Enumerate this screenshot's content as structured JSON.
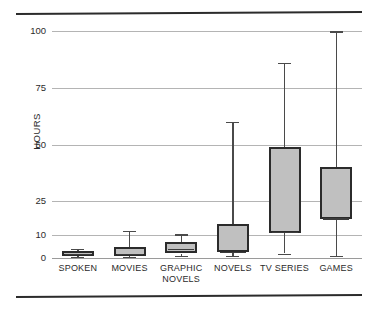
{
  "chart_data": {
    "type": "box",
    "title": "",
    "xlabel": "",
    "ylabel": "HOURS",
    "ylim": [
      0,
      100
    ],
    "yticks": [
      0,
      10,
      25,
      50,
      75,
      100
    ],
    "ytick_labels": [
      "0",
      "10",
      "25",
      "50",
      "75",
      "100"
    ],
    "grid": true,
    "legend": "none",
    "categories": [
      "SPOKEN",
      "MOVIES",
      "GRAPHIC\nNOVELS",
      "NOVELS",
      "TV SERIES",
      "GAMES"
    ],
    "boxes": [
      {
        "label": "SPOKEN",
        "whisker_low": 0.5,
        "q1": 1.0,
        "median": 2.0,
        "q3": 3.0,
        "whisker_high": 4.0
      },
      {
        "label": "MOVIES",
        "whisker_low": 0.5,
        "q1": 0.8,
        "median": 2.0,
        "q3": 5.0,
        "whisker_high": 12.0
      },
      {
        "label": "GRAPHIC NOVELS",
        "whisker_low": 1.0,
        "q1": 2.0,
        "median": 4.0,
        "q3": 7.0,
        "whisker_high": 10.5
      },
      {
        "label": "NOVELS",
        "whisker_low": 1.0,
        "q1": 2.5,
        "median": 2.8,
        "q3": 15.0,
        "whisker_high": 60.0
      },
      {
        "label": "TV SERIES",
        "whisker_low": 2.0,
        "q1": 11.0,
        "median": 11.5,
        "q3": 49.0,
        "whisker_high": 86.0
      },
      {
        "label": "GAMES",
        "whisker_low": 1.0,
        "q1": 17.0,
        "median": 17.5,
        "q3": 40.0,
        "whisker_high": 100.0
      }
    ],
    "colors": {
      "box_fill": "#c0c0c0",
      "box_edge": "#2b2b2b",
      "whisker": "#4a4a4a",
      "grid": "#b4b4b4",
      "text": "#2b2b2b",
      "rule": "#2b2b2b"
    }
  }
}
